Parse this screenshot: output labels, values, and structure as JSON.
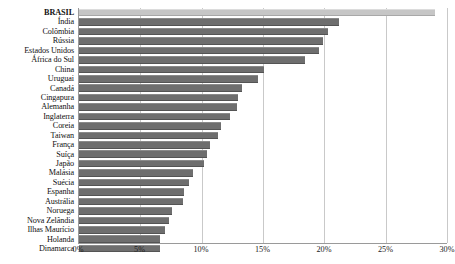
{
  "chart_data": {
    "type": "bar",
    "orientation": "horizontal",
    "title": "",
    "xlabel": "",
    "ylabel": "",
    "xlim": [
      0,
      30
    ],
    "xticks": [
      "0%",
      "5%",
      "10%",
      "15%",
      "20%",
      "25%",
      "30%"
    ],
    "xtick_values": [
      0,
      5,
      10,
      15,
      20,
      25,
      30
    ],
    "grid": true,
    "legend": "none",
    "value_suffix": "%",
    "highlight_category": "BRASIL",
    "colors": {
      "bar": "#6e6e6e",
      "highlight_bar": "#c6c6c6",
      "gridline": "#c9c9c9",
      "axis": "#9a9a9a",
      "text": "#111111",
      "background": "#ffffff"
    },
    "categories": [
      "BRASIL",
      "Índia",
      "Colômbia",
      "Rússia",
      "Estados Unidos",
      "África do Sul",
      "China",
      "Uruguai",
      "Canadá",
      "Cingapura",
      "Alemanha",
      "Inglaterra",
      "Coreia",
      "Taiwan",
      "França",
      "Suíça",
      "Japão",
      "Malásia",
      "Suécia",
      "Espanha",
      "Austrália",
      "Noruega",
      "Nova Zelândia",
      "Ilhas Maurício",
      "Holanda",
      "Dinamarca"
    ],
    "values": [
      29.0,
      21.2,
      20.3,
      19.9,
      19.6,
      18.4,
      15.1,
      14.6,
      13.3,
      13.0,
      12.9,
      12.3,
      11.6,
      11.3,
      10.7,
      10.4,
      10.2,
      9.3,
      9.0,
      8.6,
      8.5,
      7.6,
      7.3,
      7.0,
      6.6,
      6.6
    ]
  }
}
